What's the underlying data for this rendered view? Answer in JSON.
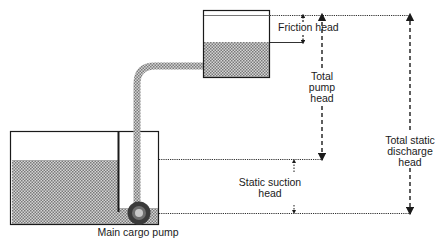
{
  "diagram": {
    "type": "cargo pump head diagram",
    "labels": {
      "friction_head": "Friction head",
      "total_pump_head": [
        "Total",
        "pump",
        "head"
      ],
      "total_static_discharge_head": [
        "Total static",
        "discharge",
        "head"
      ],
      "static_suction_head": [
        "Static suction",
        "head"
      ],
      "main_cargo_pump": "Main cargo pump"
    },
    "components": [
      {
        "name": "cargo tank",
        "position": "lower left"
      },
      {
        "name": "receiving tank",
        "position": "upper right"
      },
      {
        "name": "discharge pipe",
        "from": "main cargo pump",
        "to": "receiving tank"
      },
      {
        "name": "main cargo pump",
        "position": "bottom of cargo tank"
      }
    ],
    "measurements": [
      {
        "name": "Friction head",
        "from": "receiving tank top level",
        "to": "receiving tank liquid level"
      },
      {
        "name": "Total pump head",
        "from": "receiving tank top level",
        "to": "cargo tank liquid level"
      },
      {
        "name": "Total static discharge head",
        "from": "receiving tank top level",
        "to": "pump centerline"
      },
      {
        "name": "Static suction head",
        "from": "cargo tank liquid level",
        "to": "pump centerline"
      }
    ],
    "colors": {
      "line": "#1a1a1a",
      "liquid_fill": "#a8a8a8"
    }
  }
}
